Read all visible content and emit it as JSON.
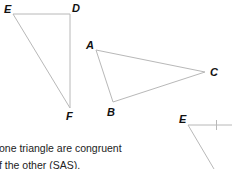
{
  "figure": {
    "triangle_def": {
      "vertices": [
        "E",
        "D",
        "F"
      ]
    },
    "triangle_abc": {
      "vertices": [
        "A",
        "B",
        "C"
      ]
    },
    "partial_triangle": {
      "vertices": [
        "E"
      ]
    },
    "labels": {
      "E1": "E",
      "D": "D",
      "F": "F",
      "A": "A",
      "B": "B",
      "C": "C",
      "E2": "E"
    },
    "line_color": "#b8b8b8"
  },
  "text": {
    "line1": "one triangle are congruent",
    "line2": "f the other (SAS)."
  }
}
